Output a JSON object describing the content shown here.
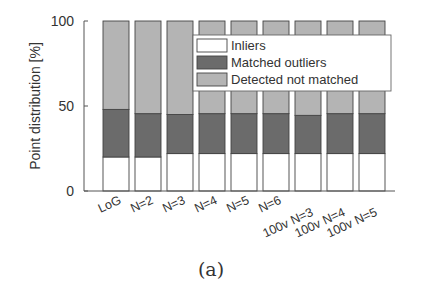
{
  "chart_data": {
    "type": "bar",
    "stacked": true,
    "title": "",
    "xlabel": "",
    "ylabel": "Point distribution [%]",
    "ylim": [
      0,
      100
    ],
    "yticks": [
      0,
      50,
      100
    ],
    "grid": false,
    "legend_position": "upper right (inside)",
    "categories": [
      "LoG",
      "N=2",
      "N=3",
      "N=4",
      "N=5",
      "N=6",
      "100v N=3",
      "100v N=4",
      "100v N=5"
    ],
    "series": [
      {
        "name": "Inliers",
        "color": "#ffffff",
        "values": [
          20,
          20,
          22,
          22,
          22,
          22,
          22,
          22,
          22
        ]
      },
      {
        "name": "Matched outliers",
        "color": "#6b6b6b",
        "values": [
          28,
          25.5,
          23,
          23.5,
          23.5,
          23.5,
          22.5,
          23.5,
          23.5
        ]
      },
      {
        "name": "Detected not matched",
        "color": "#b4b4b4",
        "values": [
          52,
          54.5,
          55,
          54.5,
          54.5,
          54.5,
          55.5,
          54.5,
          54.5
        ]
      }
    ]
  },
  "caption": "(a)"
}
